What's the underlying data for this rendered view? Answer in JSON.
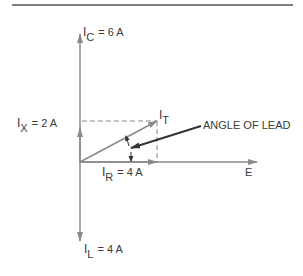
{
  "diagram": {
    "type": "phasor diagram",
    "colors": {
      "axis": "#8a8a8a",
      "rule": "#555555",
      "text": "#3a3a3a",
      "pointer": "#333333"
    },
    "labels": {
      "ic": {
        "symbol": "I",
        "sub": "C",
        "value": "= 6 A"
      },
      "ix": {
        "symbol": "I",
        "sub": "X",
        "value": "= 2 A"
      },
      "it": {
        "symbol": "I",
        "sub": "T"
      },
      "ir": {
        "symbol": "I",
        "sub": "R",
        "value": "= 4 A"
      },
      "il": {
        "symbol": "I",
        "sub": "L",
        "value": "= 4 A"
      },
      "e": "E",
      "angle": "ANGLE OF LEAD"
    }
  }
}
